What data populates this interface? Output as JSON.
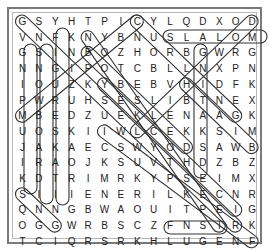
{
  "puzzle": {
    "type": "word-search",
    "rows": 15,
    "cols": 15,
    "grid": [
      "GSYHTPICYLQDXOD",
      "VNFKNYBNUSLALOM",
      "GSINBOZHORBGWRG",
      "NNGIPOTCBLLNXPN",
      "IOUZKYBEBVHIDFK",
      "PWRUHSESLIBTNEX",
      "MBEDZUEKLENAAGK",
      "UOSKIIWLCEKKSIM",
      "JAKAECSWYODSAWB",
      "IRAOJKSUVTHDZBZ",
      "KDTRIMRKYPSEIMX",
      "SIIIENERILKECNR",
      "QNNGBWAOUITPEIG",
      "OGGWRBSCZFNSIRK",
      "TCIQRSRKHLUGENF"
    ],
    "found_words": [
      {
        "word": "SLALOM",
        "start": [
          1,
          9
        ],
        "end": [
          1,
          14
        ]
      },
      {
        "word": "LUGE",
        "start": [
          14,
          9
        ],
        "end": [
          14,
          12
        ]
      },
      {
        "word": "GNISSOUR",
        "start": [
          2,
          0
        ],
        "end": [
          9,
          0
        ]
      },
      {
        "word": "SNOWBOARDING",
        "start": [
          2,
          1
        ],
        "end": [
          13,
          1
        ]
      },
      {
        "word": "FIGURESKATING",
        "start": [
          1,
          2
        ],
        "end": [
          13,
          2
        ]
      },
      {
        "word": "GNIDEPS",
        "start": [
          2,
          11
        ],
        "end": [
          13,
          11
        ]
      },
      {
        "word": "BIATHLON",
        "start": [
          6,
          0
        ],
        "end": [
          0,
          7
        ]
      },
      {
        "word": "DOWNHILL",
        "start": [
          0,
          14
        ],
        "end": [
          7,
          7
        ]
      },
      {
        "word": "SKIING",
        "start": [
          11,
          0
        ],
        "end": [
          13,
          2
        ]
      },
      {
        "word": "GSNOWSHOE",
        "start": [
          0,
          0
        ],
        "end": [
          13,
          13
        ]
      },
      {
        "word": "BOBSLED",
        "start": [
          2,
          4
        ],
        "end": [
          8,
          10
        ]
      },
      {
        "word": "YSKELETON",
        "start": [
          4,
          5
        ],
        "end": [
          12,
          13
        ]
      },
      {
        "word": "CURLING",
        "start": [
          0,
          7
        ],
        "end": [
          6,
          13
        ]
      },
      {
        "word": "NUSKIJUMP",
        "start": [
          1,
          4
        ],
        "end": [
          13,
          12
        ]
      },
      {
        "word": "SNOWB",
        "start": [
          4,
          10
        ],
        "end": [
          8,
          14
        ]
      },
      {
        "word": "SKATE",
        "start": [
          7,
          5
        ],
        "end": [
          14,
          14
        ]
      }
    ]
  },
  "style": {
    "text_color": "#222222",
    "border_color": "#7a7a7a",
    "loop_color": "#333333"
  }
}
